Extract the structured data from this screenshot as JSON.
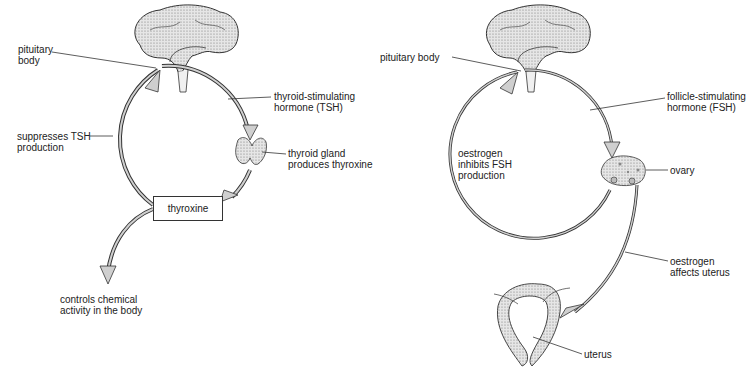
{
  "left_diagram": {
    "pituitary_label": "pituitary\nbody",
    "tsh_label": "thyroid-stimulating\nhormone (TSH)",
    "suppresses_label": "suppresses TSH\nproduction",
    "thyroid_label": "thyroid gland\nproduces thyroxine",
    "thyroxine_box": "thyroxine",
    "controls_label": "controls chemical\nactivity in the body"
  },
  "right_diagram": {
    "pituitary_label": "pituitary body",
    "fsh_label": "follicle-stimulating\nhormone (FSH)",
    "inhibits_label": "oestrogen\ninhibits FSH\nproduction",
    "ovary_label": "ovary",
    "affects_label": "oestrogen\naffects uterus",
    "uterus_label": "uterus"
  },
  "colors": {
    "line": "#333333",
    "arrow_fill": "#cfcfcf",
    "organ_fill": "#d9d9d9"
  }
}
